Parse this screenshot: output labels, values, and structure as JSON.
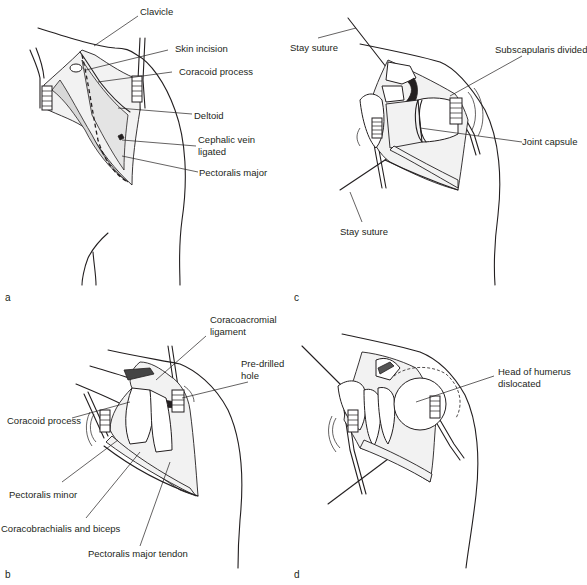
{
  "figure": {
    "panels": [
      {
        "id": "a",
        "letter": "a",
        "labels": [
          "Clavicle",
          "Skin incision",
          "Coracoid process",
          "Deltoid",
          "Cephalic vein",
          "ligated",
          "Pectoralis major"
        ]
      },
      {
        "id": "b",
        "letter": "b",
        "labels": [
          "Coracoacromial",
          "ligament",
          "Pre-drilled",
          "hole",
          "Coracoid process",
          "Pectoralis minor",
          "Coracobrachialis and biceps",
          "Pectoralis major tendon"
        ]
      },
      {
        "id": "c",
        "letter": "c",
        "labels": [
          "Stay suture",
          "Subscapularis divided",
          "Joint capsule",
          "Stay suture"
        ]
      },
      {
        "id": "d",
        "letter": "d",
        "labels": [
          "Head of humerus",
          "dislocated"
        ]
      }
    ]
  },
  "colors": {
    "ink": "#231f20",
    "background": "#ffffff"
  }
}
